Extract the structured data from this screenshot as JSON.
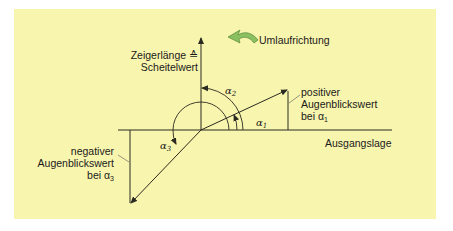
{
  "diagram": {
    "background_color": "#f8f5ae",
    "line_color": "#2a2a20",
    "arrow_icon_color": "#8ac060",
    "labels": {
      "y_axis_line1": "Zeigerlänge ≙",
      "y_axis_line2": "Scheitelwert",
      "rotation_direction": "Umlaufrichtung",
      "positive_line1": "positiver",
      "positive_line2": "Augenblickswert",
      "positive_line3": "bei α",
      "positive_sub": "1",
      "negative_line1": "negativer",
      "negative_line2": "Augenblickswert",
      "negative_line3": "bei α",
      "negative_sub": "3",
      "baseline": "Ausgangslage",
      "alpha1": "α",
      "alpha1_sub": "1",
      "alpha2": "α",
      "alpha2_sub": "2",
      "alpha3": "α",
      "alpha3_sub": "3"
    }
  }
}
